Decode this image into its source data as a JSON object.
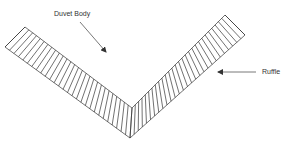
{
  "labels": {
    "duvet_body": "Duvet Body",
    "ruffle": "Ruffle"
  },
  "colors": {
    "stroke": "#333333",
    "background": "#ffffff"
  },
  "geometry": {
    "left_band": {
      "outer_start": [
        5,
        47
      ],
      "inner_start": [
        25,
        27
      ],
      "inner_end": [
        132,
        108
      ],
      "outer_end": [
        130,
        138
      ]
    },
    "right_band": {
      "inner_start": [
        132,
        108
      ],
      "outer_start": [
        130,
        138
      ],
      "inner_end": [
        225,
        15
      ],
      "outer_end": [
        245,
        35
      ]
    },
    "duvet_arrow": {
      "from": [
        80,
        22
      ],
      "to": [
        106,
        52
      ]
    },
    "ruffle_arrow": {
      "from": [
        256,
        72
      ],
      "to": [
        218,
        72
      ]
    },
    "pleat_count_per_band": 28
  }
}
